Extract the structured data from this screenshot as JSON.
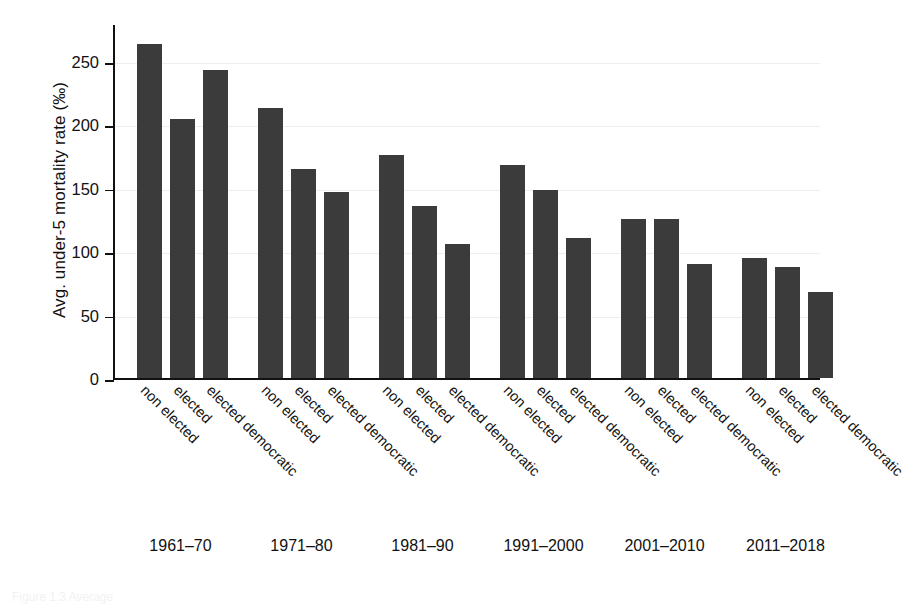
{
  "chart_data": {
    "type": "bar",
    "title": "",
    "xlabel": "",
    "ylabel": "Avg. under-5 mortality rate (‰)",
    "ylim": [
      0,
      280
    ],
    "ytick_values": [
      0,
      50,
      100,
      150,
      200,
      250
    ],
    "ytick_labels": [
      "0",
      "50",
      "100",
      "150",
      "200",
      "250"
    ],
    "grid": true,
    "legend": "none",
    "bar_color": "#3b3b3b",
    "categories": [
      "non elected",
      "elected",
      "elected democratic"
    ],
    "groups": [
      {
        "period": "1961–70",
        "bars": [
          {
            "category": "non elected",
            "value": 264
          },
          {
            "category": "elected",
            "value": 205
          },
          {
            "category": "elected democratic",
            "value": 243
          }
        ]
      },
      {
        "period": "1971–80",
        "bars": [
          {
            "category": "non elected",
            "value": 213
          },
          {
            "category": "elected",
            "value": 165
          },
          {
            "category": "elected democratic",
            "value": 147
          }
        ]
      },
      {
        "period": "1981–90",
        "bars": [
          {
            "category": "non elected",
            "value": 176
          },
          {
            "category": "elected",
            "value": 136
          },
          {
            "category": "elected democratic",
            "value": 106
          }
        ]
      },
      {
        "period": "1991–2000",
        "bars": [
          {
            "category": "non elected",
            "value": 168
          },
          {
            "category": "elected",
            "value": 149
          },
          {
            "category": "elected democratic",
            "value": 111
          }
        ]
      },
      {
        "period": "2001–2010",
        "bars": [
          {
            "category": "non elected",
            "value": 126
          },
          {
            "category": "elected",
            "value": 126
          },
          {
            "category": "elected democratic",
            "value": 90
          }
        ]
      },
      {
        "period": "2011–2018",
        "bars": [
          {
            "category": "non elected",
            "value": 95
          },
          {
            "category": "elected",
            "value": 88
          },
          {
            "category": "elected democratic",
            "value": 68
          }
        ]
      }
    ]
  },
  "caption": "Figure 1.3 Average"
}
